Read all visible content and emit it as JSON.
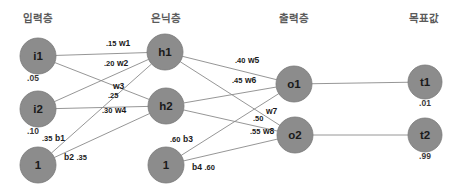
{
  "diagram": {
    "type": "neural-network",
    "title": "",
    "width": 464,
    "height": 194,
    "background_color": "#ffffff",
    "node_fill_color": "#8c8c8c",
    "edge_color": "#8a8a8a",
    "text_color": "#1a1a1a",
    "title_color": "#5a5a5a"
  },
  "layer_titles": [
    {
      "id": "input-layer-title",
      "label": "입력층",
      "x": 38,
      "y": 22
    },
    {
      "id": "hidden-layer-title",
      "label": "은닉층",
      "x": 166,
      "y": 22
    },
    {
      "id": "output-layer-title",
      "label": "출력층",
      "x": 294,
      "y": 22
    },
    {
      "id": "target-layer-title",
      "label": "목표값",
      "x": 424,
      "y": 22
    }
  ],
  "nodes": [
    {
      "id": "i1",
      "label": "i1",
      "x": 38,
      "y": 56,
      "r": 18,
      "value": ".05",
      "value_x": 33,
      "value_y": 81
    },
    {
      "id": "i2",
      "label": "i2",
      "x": 38,
      "y": 109,
      "r": 18,
      "value": ".10",
      "value_x": 33,
      "value_y": 134
    },
    {
      "id": "bias1",
      "label": "1",
      "x": 38,
      "y": 165,
      "r": 18,
      "value": "",
      "value_x": 38,
      "value_y": 190
    },
    {
      "id": "h1",
      "label": "h1",
      "x": 165,
      "y": 52,
      "r": 18,
      "value": "",
      "value_x": 165,
      "value_y": 77
    },
    {
      "id": "h2",
      "label": "h2",
      "x": 166,
      "y": 106,
      "r": 18,
      "value": "",
      "value_x": 166,
      "value_y": 131
    },
    {
      "id": "bias2",
      "label": "1",
      "x": 166,
      "y": 165,
      "r": 18,
      "value": "",
      "value_x": 166,
      "value_y": 190
    },
    {
      "id": "o1",
      "label": "o1",
      "x": 294,
      "y": 84,
      "r": 18,
      "value": "",
      "value_x": 294,
      "value_y": 109
    },
    {
      "id": "o2",
      "label": "o2",
      "x": 295,
      "y": 135,
      "r": 18,
      "value": "",
      "value_x": 295,
      "value_y": 160
    },
    {
      "id": "t1",
      "label": "t1",
      "x": 425,
      "y": 82,
      "r": 17,
      "value": ".01",
      "value_x": 425,
      "value_y": 106
    },
    {
      "id": "t2",
      "label": "t2",
      "x": 425,
      "y": 135,
      "r": 17,
      "value": ".99",
      "value_x": 425,
      "value_y": 159
    }
  ],
  "edges": [
    {
      "id": "i1-h1",
      "from": "i1",
      "to": "h1"
    },
    {
      "id": "i1-h2",
      "from": "i1",
      "to": "h2"
    },
    {
      "id": "i2-h1",
      "from": "i2",
      "to": "h1"
    },
    {
      "id": "i2-h2",
      "from": "i2",
      "to": "h2"
    },
    {
      "id": "bias1-h1",
      "from": "bias1",
      "to": "h1"
    },
    {
      "id": "bias1-h2",
      "from": "bias1",
      "to": "h2"
    },
    {
      "id": "h1-o1",
      "from": "h1",
      "to": "o1"
    },
    {
      "id": "h1-o2",
      "from": "h1",
      "to": "o2"
    },
    {
      "id": "h2-o1",
      "from": "h2",
      "to": "o1"
    },
    {
      "id": "h2-o2",
      "from": "h2",
      "to": "o2"
    },
    {
      "id": "bias2-o1",
      "from": "bias2",
      "to": "o1"
    },
    {
      "id": "bias2-o2",
      "from": "bias2",
      "to": "o2"
    },
    {
      "id": "o1-t1",
      "from": "o1",
      "to": "t1"
    },
    {
      "id": "o2-t2",
      "from": "o2",
      "to": "t2"
    }
  ],
  "edge_labels": [
    {
      "id": "w1",
      "weight": ".15",
      "name": "w1",
      "x": 106,
      "y": 46,
      "order": "num-first"
    },
    {
      "id": "w2",
      "weight": ".20",
      "name": "w2",
      "x": 104,
      "y": 66,
      "order": "num-first"
    },
    {
      "id": "w3",
      "weight": ".25",
      "name": "w3",
      "x": 108,
      "y": 98,
      "order": "num-first",
      "name_x": 113,
      "name_y": 89
    },
    {
      "id": "w4",
      "weight": ".30",
      "name": "w4",
      "x": 102,
      "y": 113,
      "order": "num-first"
    },
    {
      "id": "b1",
      "weight": ".35",
      "name": "b1",
      "x": 42,
      "y": 141,
      "order": "num-first"
    },
    {
      "id": "b2",
      "weight": ".35",
      "name": "b2",
      "x": 64,
      "y": 160,
      "order": "name-first"
    },
    {
      "id": "w5",
      "weight": ".40",
      "name": "w5",
      "x": 235,
      "y": 63,
      "order": "num-first"
    },
    {
      "id": "w6",
      "weight": ".45",
      "name": "w6",
      "x": 232,
      "y": 83,
      "order": "num-first"
    },
    {
      "id": "w7",
      "weight": ".50",
      "name": "w7",
      "x": 253,
      "y": 121,
      "order": "num-first",
      "name_x": 266,
      "name_y": 114
    },
    {
      "id": "w8",
      "weight": ".55",
      "name": "w8",
      "x": 250,
      "y": 134,
      "order": "num-first"
    },
    {
      "id": "b3",
      "weight": ".60",
      "name": "b3",
      "x": 170,
      "y": 142,
      "order": "num-first"
    },
    {
      "id": "b4",
      "weight": ".60",
      "name": "b4",
      "x": 192,
      "y": 170,
      "order": "name-first"
    }
  ]
}
